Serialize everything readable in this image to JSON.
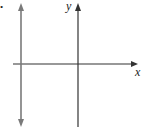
{
  "figure": {
    "marker": "•",
    "x_axis_label": "x",
    "y_axis_label": "y",
    "line_description": "vertical line x = a (a < 0)",
    "colors": {
      "axes": "#333333",
      "line": "#7a7a7a",
      "background": "#ffffff"
    }
  }
}
